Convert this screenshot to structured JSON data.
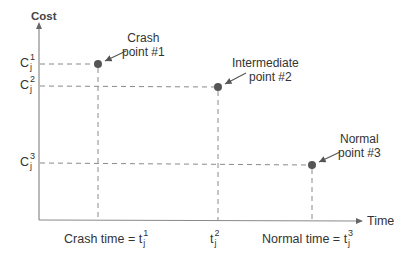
{
  "diagram": {
    "y_axis_label": "Cost",
    "x_axis_label": "Time",
    "colors": {
      "axis": "#8a8a8a",
      "dash": "#8a8a8a",
      "point": "#555555",
      "text": "#333333"
    },
    "y_ticks": [
      {
        "base": "C",
        "sup": "1",
        "sub": "j"
      },
      {
        "base": "C",
        "sup": "2",
        "sub": "j"
      },
      {
        "base": "C",
        "sup": "3",
        "sub": "j"
      }
    ],
    "x_ticks": [
      {
        "prefix": "Crash time = ",
        "base": "t",
        "sup": "1",
        "sub": "j"
      },
      {
        "prefix": "",
        "base": "t",
        "sup": "2",
        "sub": "j"
      },
      {
        "prefix": "Normal time = ",
        "base": "t",
        "sup": "3",
        "sub": "j"
      }
    ],
    "points": [
      {
        "line1": "Crash",
        "line2": "point #1"
      },
      {
        "line1": "Intermediate",
        "line2": "point #2"
      },
      {
        "line1": "Normal",
        "line2": "point #3"
      }
    ]
  }
}
